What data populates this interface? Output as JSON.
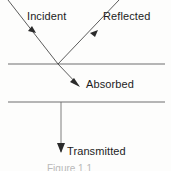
{
  "figure": {
    "background_color": "#fdfdfc",
    "stroke_color": "#4a4a4a",
    "text_color": "#1c1c1c",
    "caption": "Figure 1.1"
  },
  "labels": {
    "incident": "Incident",
    "reflected": "Reflected",
    "absorbed": "Absorbed",
    "transmitted": "Transmitted"
  },
  "icons": {
    "incident_ray": "arrow-down-right-icon",
    "reflected_ray": "arrow-down-left-icon",
    "absorbed_ray": "arrow-down-right-icon",
    "transmitted_ray": "arrow-down-icon",
    "top_surface": "horizontal-line-icon",
    "bottom_surface": "horizontal-line-icon"
  },
  "geometry": {
    "top_surface_y": 64,
    "bottom_surface_y": 102,
    "surface_x_start": 8,
    "surface_x_end": 165,
    "intersection_x": 58,
    "intersection_y": 64,
    "incident_start": "8,0",
    "reflected_end": "119,0",
    "absorbed_tip": "79,86",
    "transmitted_tip": "61,152"
  }
}
